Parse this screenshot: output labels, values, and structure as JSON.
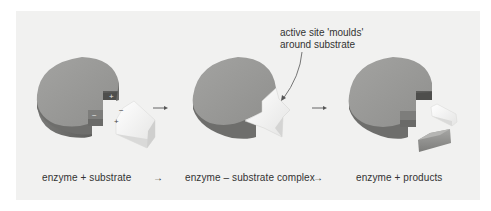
{
  "diagram": {
    "title": "",
    "colors": {
      "panel_bg": "#f1f1f0",
      "enzyme_top": "#9a9a98",
      "enzyme_side": "#6f6f6d",
      "site_dark": "#5c5c5a",
      "site_mid": "#808080",
      "substrate_light": "#fbfbfb",
      "text": "#333333"
    },
    "stages": [
      {
        "id": "stage-1",
        "label": "enzyme + substrate",
        "charges": {
          "enzyme_upper": "+",
          "enzyme_lower": "−",
          "substrate_upper": "−",
          "substrate_lower": "+"
        }
      },
      {
        "id": "stage-2",
        "label": "enzyme – substrate complex"
      },
      {
        "id": "stage-3",
        "label": "enzyme + products"
      }
    ],
    "arrows": [
      "→",
      "→"
    ],
    "label_arrows": [
      "→",
      "→"
    ],
    "annotation": {
      "line1": "active site 'moulds'",
      "line2": "around substrate"
    }
  }
}
